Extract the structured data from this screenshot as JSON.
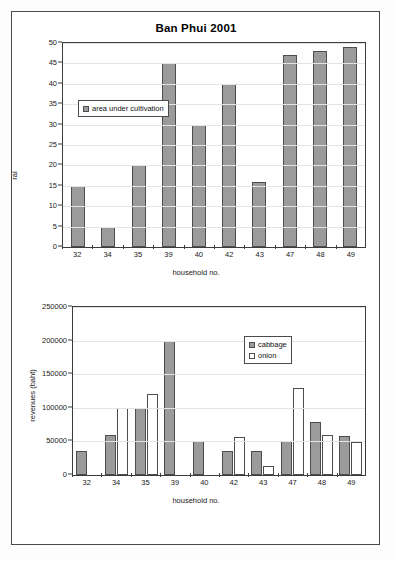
{
  "page": {
    "background_color": "#ffffff",
    "border_color": "#4a4a4a"
  },
  "charts": [
    {
      "id": "chart1",
      "title": "Ban Phui 2001",
      "xlabel": "household no.",
      "ylabel": "rai",
      "legend_items": [
        "area under cultivation"
      ]
    },
    {
      "id": "chart2",
      "title": "",
      "xlabel": "household no.",
      "ylabel": "revenues (baht)",
      "legend_items": [
        "cabbage",
        "onion"
      ]
    }
  ],
  "chart_data": [
    {
      "type": "bar",
      "title": "Ban Phui 2001",
      "xlabel": "household no.",
      "ylabel": "rai",
      "categories": [
        "32",
        "34",
        "35",
        "39",
        "40",
        "42",
        "43",
        "47",
        "48",
        "49"
      ],
      "series": [
        {
          "name": "area under cultivation",
          "color": "#9b9b9b",
          "values": [
            15,
            5,
            20,
            45,
            30,
            40,
            16,
            47,
            48,
            49
          ]
        }
      ],
      "ylim": [
        0,
        50
      ],
      "yticks": [
        0,
        5,
        10,
        15,
        20,
        25,
        30,
        35,
        40,
        45,
        50
      ],
      "grid": true,
      "legend_position": "upper-left-inside"
    },
    {
      "type": "bar",
      "title": "",
      "xlabel": "household no.",
      "ylabel": "revenues (baht)",
      "categories": [
        "32",
        "34",
        "35",
        "39",
        "40",
        "42",
        "43",
        "47",
        "48",
        "49"
      ],
      "series": [
        {
          "name": "cabbage",
          "color": "#9b9b9b",
          "values": [
            35000,
            60000,
            100000,
            200000,
            50000,
            35000,
            35000,
            50000,
            79000,
            58000
          ]
        },
        {
          "name": "onion",
          "color": "#ffffff",
          "values": [
            0,
            100000,
            120000,
            0,
            0,
            57000,
            14000,
            130000,
            59000,
            49000
          ]
        }
      ],
      "ylim": [
        0,
        250000
      ],
      "yticks": [
        0,
        50000,
        100000,
        150000,
        200000,
        250000
      ],
      "grid": true,
      "legend_position": "upper-right-inside"
    }
  ]
}
